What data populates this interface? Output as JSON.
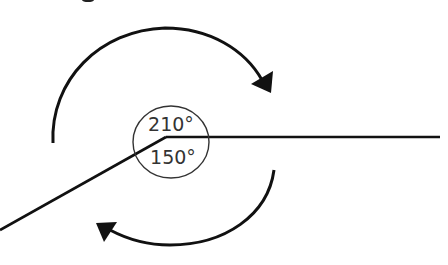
{
  "diagram": {
    "labels": {
      "reflex_angle": "210°",
      "obtuse_angle": "150°"
    },
    "angles": [
      {
        "name": "reflex",
        "degrees": 210,
        "direction": "clockwise",
        "arrow": "upper"
      },
      {
        "name": "obtuse",
        "degrees": 150,
        "direction": "clockwise",
        "arrow": "lower"
      }
    ],
    "colors": {
      "line": "#111111",
      "circle": "#333333",
      "text": "#333333",
      "background": "#ffffff"
    }
  }
}
